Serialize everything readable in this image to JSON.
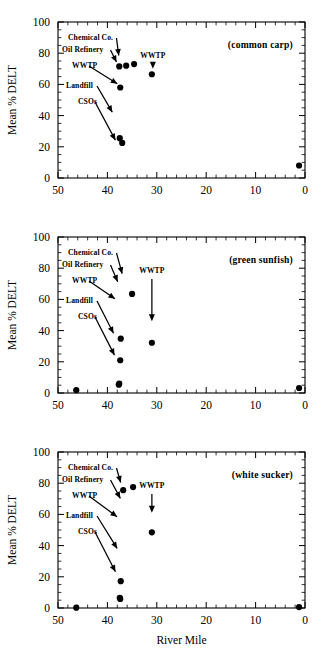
{
  "figure": {
    "xlabel": "River Mile",
    "ylabel": "Mean % DELT",
    "x_ticks": [
      "50",
      "40",
      "30",
      "20",
      "10",
      "0"
    ],
    "y_ticks": [
      "0",
      "20",
      "40",
      "60",
      "80",
      "100"
    ]
  },
  "annotation_labels": {
    "chemical": "Chemical  Co.",
    "refinery": "Oil  Refinery",
    "wwtp_left": "WWTP",
    "landfill": "Landfill",
    "csos": "CSOs",
    "wwtp_right": "WWTP"
  },
  "panels": [
    {
      "id": "common-carp",
      "title": "(common   carp)",
      "show_xlabel": false
    },
    {
      "id": "green-sunfish",
      "title": "(green   sunfish)",
      "show_xlabel": false
    },
    {
      "id": "white-sucker",
      "title": "(white   sucker)",
      "show_xlabel": true
    }
  ],
  "chart_data": [
    {
      "type": "scatter",
      "title": "(common   carp)",
      "xlabel": "River Mile",
      "ylabel": "Mean % DELT",
      "xlim": [
        50,
        0
      ],
      "ylim": [
        0,
        100
      ],
      "x_ticks": [
        50,
        40,
        30,
        20,
        10,
        0
      ],
      "y_ticks": [
        0,
        20,
        40,
        60,
        80,
        100
      ],
      "grid": false,
      "x": [
        37.6,
        36.2,
        34.6,
        31.0,
        37.4,
        37.0,
        37.5,
        1.2
      ],
      "y": [
        71.5,
        72.0,
        73.0,
        66.5,
        58.0,
        22.5,
        25.5,
        8.0
      ],
      "annotations": [
        {
          "label": "Chemical  Co.",
          "points_to_x": 37.6,
          "points_to_y": 76
        },
        {
          "label": "Oil  Refinery",
          "points_to_x": 37.8,
          "points_to_y": 72
        },
        {
          "label": "WWTP",
          "points_to_x": 37.3,
          "points_to_y": 59
        },
        {
          "label": "Landfill",
          "points_to_x": 38.6,
          "points_to_y": 40
        },
        {
          "label": "CSOs",
          "points_to_x": 38.0,
          "points_to_y": 22
        },
        {
          "label": "WWTP",
          "points_to_x": 31.2,
          "points_to_y": 70
        }
      ]
    },
    {
      "type": "scatter",
      "title": "(green   sunfish)",
      "xlabel": "River Mile",
      "ylabel": "Mean % DELT",
      "xlim": [
        50,
        0
      ],
      "ylim": [
        0,
        100
      ],
      "x_ticks": [
        50,
        40,
        30,
        20,
        10,
        0
      ],
      "y_ticks": [
        0,
        20,
        40,
        60,
        80,
        100
      ],
      "grid": false,
      "x": [
        46.3,
        37.7,
        37.6,
        37.4,
        37.3,
        35.0,
        31.0,
        1.2
      ],
      "y": [
        1.8,
        5.3,
        6.0,
        21.0,
        34.8,
        63.5,
        32.2,
        3.2
      ],
      "annotations": [
        {
          "label": "Chemical  Co.",
          "points_to_x": 36.8,
          "points_to_y": 74
        },
        {
          "label": "Oil  Refinery",
          "points_to_x": 37.6,
          "points_to_y": 69
        },
        {
          "label": "WWTP",
          "points_to_x": 37.8,
          "points_to_y": 59
        },
        {
          "label": "Landfill",
          "points_to_x": 38.4,
          "points_to_y": 36
        },
        {
          "label": "CSOs",
          "points_to_x": 38.2,
          "points_to_y": 22
        },
        {
          "label": "WWTP",
          "points_to_x": 31.4,
          "points_to_y": 46
        }
      ]
    },
    {
      "type": "scatter",
      "title": "(white   sucker)",
      "xlabel": "River Mile",
      "ylabel": "Mean % DELT",
      "xlim": [
        50,
        0
      ],
      "ylim": [
        0,
        100
      ],
      "x_ticks": [
        50,
        40,
        30,
        20,
        10,
        0
      ],
      "y_ticks": [
        0,
        20,
        40,
        60,
        80,
        100
      ],
      "grid": false,
      "x": [
        46.3,
        37.4,
        37.5,
        37.3,
        36.8,
        34.8,
        31.0,
        1.2
      ],
      "y": [
        0.2,
        5.8,
        6.5,
        17.2,
        75.5,
        77.5,
        48.5,
        0.6
      ],
      "annotations": [
        {
          "label": "Chemical  Co.",
          "points_to_x": 37.1,
          "points_to_y": 78
        },
        {
          "label": "Oil  Refinery",
          "points_to_x": 37.0,
          "points_to_y": 68
        },
        {
          "label": "WWTP",
          "points_to_x": 37.4,
          "points_to_y": 57
        },
        {
          "label": "Landfill",
          "points_to_x": 37.6,
          "points_to_y": 36
        },
        {
          "label": "CSOs",
          "points_to_x": 38.0,
          "points_to_y": 21
        },
        {
          "label": "WWTP",
          "points_to_x": 31.4,
          "points_to_y": 61
        }
      ]
    }
  ]
}
